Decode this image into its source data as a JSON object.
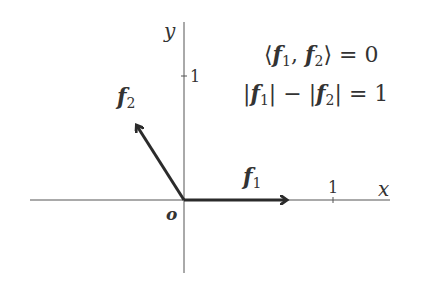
{
  "diagram": {
    "axes": {
      "x_label": "x",
      "y_label": "y",
      "origin_label": "o",
      "x_tick_label": "1",
      "y_tick_label": "1"
    },
    "vectors": [
      {
        "name": "f",
        "subscript": "1",
        "direction": "along positive x-axis"
      },
      {
        "name": "f",
        "subscript": "2",
        "direction": "up-left, perpendicular to f1"
      }
    ],
    "equations": {
      "line1": {
        "lhs_open": "⟨",
        "v1": "f",
        "s1": "1",
        "sep": ", ",
        "v2": "f",
        "s2": "2",
        "lhs_close": "⟩",
        "rhs": " = 0"
      },
      "line2": {
        "bar": "|",
        "v1": "f",
        "s1": "1",
        "minus": " − ",
        "v2": "f",
        "s2": "2",
        "rhs": " = 1"
      }
    },
    "colors": {
      "axis": "#555555",
      "vector": "#2b2b2b",
      "text": "#333333",
      "background": "#ffffff"
    }
  }
}
